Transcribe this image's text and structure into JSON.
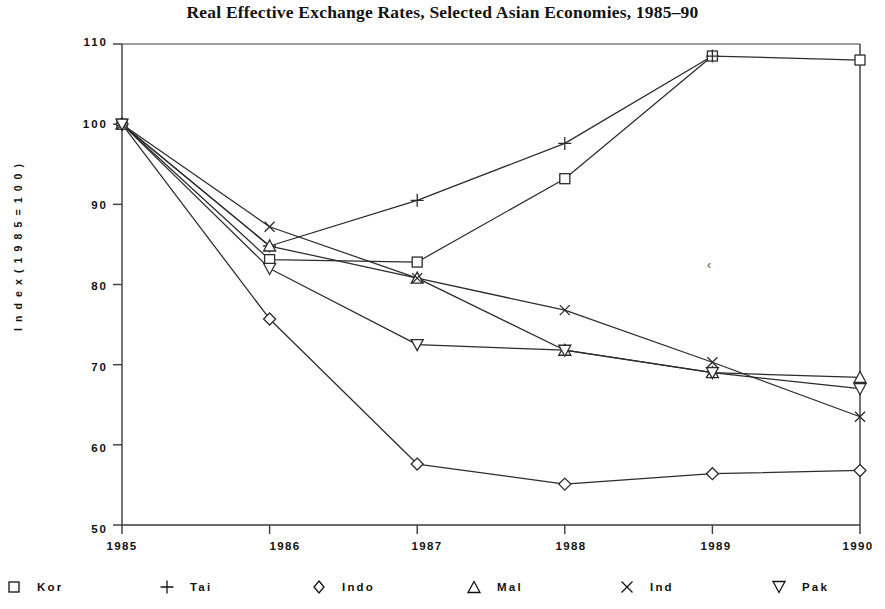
{
  "title": "Real Effective Exchange Rates, Selected Asian Economies, 1985–90",
  "axes": {
    "y_title": "I n d e x   ( 1 9 8 5   =   1 0 0 )",
    "y_ticks": [
      "110",
      "100",
      "90",
      "80",
      "70",
      "60",
      "50"
    ],
    "x_ticks": [
      "1985",
      "1986",
      "1987",
      "1988",
      "1989",
      "1990"
    ]
  },
  "legend": {
    "items": [
      {
        "label": "Kor",
        "marker": "square"
      },
      {
        "label": "Tai",
        "marker": "plus"
      },
      {
        "label": "Indo",
        "marker": "diamond"
      },
      {
        "label": "Mal",
        "marker": "triangle-up"
      },
      {
        "label": "Ind",
        "marker": "cross"
      },
      {
        "label": "Pak",
        "marker": "triangle-down"
      }
    ]
  },
  "chart_data": {
    "type": "line",
    "title": "Real Effective Exchange Rates, Selected Asian Economies, 1985–90",
    "xlabel": "",
    "ylabel": "Index (1985 = 100)",
    "x": [
      1985,
      1986,
      1987,
      1988,
      1989,
      1990
    ],
    "categories": [
      "1985",
      "1986",
      "1987",
      "1988",
      "1989",
      "1990"
    ],
    "xlim": [
      1985,
      1990
    ],
    "ylim": [
      50,
      110
    ],
    "yticks": [
      50,
      60,
      70,
      80,
      90,
      100,
      110
    ],
    "grid": false,
    "legend_position": "bottom",
    "series": [
      {
        "name": "Kor",
        "marker": "square",
        "values": [
          100.0,
          83.1,
          82.8,
          93.2,
          108.5,
          108.0
        ]
      },
      {
        "name": "Tai",
        "marker": "plus",
        "values": [
          100.0,
          84.8,
          90.5,
          97.6,
          108.5,
          null
        ]
      },
      {
        "name": "Indo",
        "marker": "diamond",
        "values": [
          100.0,
          75.7,
          57.6,
          55.1,
          56.4,
          56.8
        ]
      },
      {
        "name": "Mal",
        "marker": "triangle-up",
        "values": [
          100.0,
          84.8,
          80.8,
          71.8,
          69.0,
          68.4
        ]
      },
      {
        "name": "Ind",
        "marker": "cross",
        "values": [
          100.0,
          87.2,
          80.8,
          76.8,
          70.3,
          63.5
        ]
      },
      {
        "name": "Pak",
        "marker": "triangle-down",
        "values": [
          100.0,
          82.0,
          72.5,
          71.8,
          69.0,
          67.0
        ]
      }
    ]
  }
}
